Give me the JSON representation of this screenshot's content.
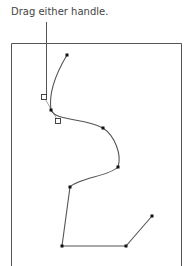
{
  "caption": {
    "text": "Drag either handle."
  },
  "colors": {
    "frame": "#555555",
    "path": "#555555",
    "anchor": "#111111",
    "handle_stroke": "#333333",
    "handle_fill": "#ffffff",
    "callout": "#555555",
    "text": "#444444"
  },
  "frame": {
    "left": 11,
    "top": 43,
    "right": 181,
    "bottom": 266
  },
  "callout": {
    "x": 46,
    "y1": 22,
    "y2": 95
  },
  "anchors": [
    {
      "x": 67,
      "y": 55
    },
    {
      "x": 51,
      "y": 110
    },
    {
      "x": 103,
      "y": 128
    },
    {
      "x": 118,
      "y": 167
    },
    {
      "x": 70,
      "y": 187
    },
    {
      "x": 62,
      "y": 246
    },
    {
      "x": 126,
      "y": 246
    },
    {
      "x": 152,
      "y": 216
    }
  ],
  "handles": [
    {
      "x": 44,
      "y": 97,
      "name": "direction-handle-in"
    },
    {
      "x": 58,
      "y": 121,
      "name": "direction-handle-out"
    }
  ]
}
